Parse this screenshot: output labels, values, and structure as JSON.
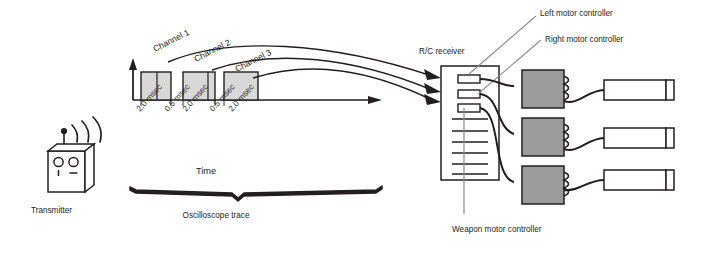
{
  "diagram": {
    "background_color": "#ffffff",
    "line_color": "#231f20",
    "fill_gray": "#9b9b9b",
    "pulse_fill": "#d8d8d8",
    "white_fill": "#ffffff"
  },
  "transmitter": {
    "label": "Transmitter",
    "antenna_icon": "antenna-icon",
    "wave_icon": "radio-wave-icon",
    "control_icon": "joystick-icon",
    "control_count": 2
  },
  "waveform": {
    "axis_label": "Time",
    "y_axis_icon": "amplitude-axis-arrow-icon",
    "x_axis_icon": "time-axis-arrow-icon",
    "pulses": [
      {
        "label": "Channel 1",
        "width_msec": "2.0 msec"
      },
      {
        "label": "Channel 2",
        "width_msec": "2.0 msec"
      },
      {
        "label": "Channel 3",
        "width_msec": "2.0 msec"
      }
    ],
    "timing_labels": [
      "2.0 msec",
      "0.5 msec",
      "2.0 msec",
      "0.5 msec",
      "2.0 msec"
    ],
    "channel_labels": [
      "Channel 1",
      "Channel 2",
      "Channel 3"
    ],
    "trace_label": "Oscilloscope trace",
    "trace_icon": "oscilloscope-brace-icon"
  },
  "receiver": {
    "label": "R/C receiver",
    "connector_count": 3,
    "rib_count": 6
  },
  "controllers": [
    {
      "label": "Left motor controller",
      "coil_icon": "coil-icon",
      "motor_icon": "motor-cylinder-icon"
    },
    {
      "label": "Right motor controller",
      "coil_icon": "coil-icon",
      "motor_icon": "motor-cylinder-icon"
    },
    {
      "label": "Weapon motor controller",
      "coil_icon": "coil-icon",
      "motor_icon": "motor-cylinder-icon"
    }
  ],
  "callouts": {
    "left": "Left motor controller",
    "right": "Right motor controller",
    "weapon": "Weapon motor controller"
  }
}
